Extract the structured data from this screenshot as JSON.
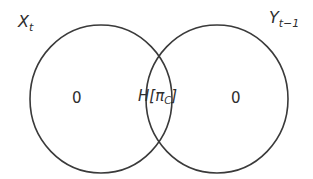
{
  "diagram": {
    "type": "venn",
    "sets": [
      {
        "id": "left",
        "label_main": "X",
        "label_sub": "t",
        "cx": 101,
        "cy": 99,
        "rx": 71,
        "ry": 74
      },
      {
        "id": "right",
        "label_main": "Y",
        "label_sub": "t−1",
        "cx": 217,
        "cy": 99,
        "rx": 71,
        "ry": 74
      }
    ],
    "regions": {
      "left_only": "0",
      "intersection_prefix": "H[π",
      "intersection_sub": "C",
      "intersection_suffix": "]",
      "right_only": "0"
    },
    "colors": {
      "stroke": "#3a3a3a",
      "text": "#2e2e2e",
      "background": "#ffffff"
    }
  }
}
